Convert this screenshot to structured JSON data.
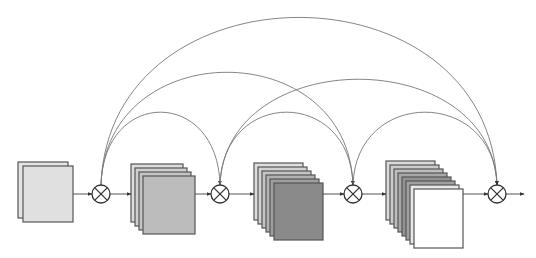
{
  "diagram": {
    "type": "dense-connectivity-block",
    "colors": {
      "line": "#555555",
      "arc": "#777777",
      "sheet_stroke": "#555555",
      "operator_stroke": "#333333",
      "background": "#ffffff"
    },
    "operator_symbol": "circled-times",
    "operators": [
      {
        "id": "op1",
        "cx": 101,
        "cy": 194,
        "r": 9
      },
      {
        "id": "op2",
        "cx": 220,
        "cy": 194,
        "r": 9
      },
      {
        "id": "op3",
        "cx": 353,
        "cy": 194,
        "r": 9
      },
      {
        "id": "op4",
        "cx": 497,
        "cy": 194,
        "r": 9
      }
    ],
    "stacks": [
      {
        "id": "stack1",
        "x": 18,
        "y": 162,
        "w": 50,
        "h": 56,
        "dx": 5,
        "dy": 4,
        "fills": [
          "#e4e4e4",
          "#e0e0e0"
        ]
      },
      {
        "id": "stack2",
        "x": 131,
        "y": 164,
        "w": 52,
        "h": 58,
        "dx": 4,
        "dy": 4,
        "fills": [
          "#dcdcdc",
          "#d0d0d0",
          "#c4c4c4",
          "#bcbcbc"
        ]
      },
      {
        "id": "stack3",
        "x": 254,
        "y": 163,
        "w": 49,
        "h": 57,
        "dx": 4,
        "dy": 4,
        "fills": [
          "#dedede",
          "#d2d2d2",
          "#c4c4c4",
          "#b2b2b2",
          "#9e9e9e",
          "#8a8a8a"
        ]
      },
      {
        "id": "stack4",
        "x": 386,
        "y": 161,
        "w": 49,
        "h": 59,
        "dx": 4,
        "dy": 4,
        "fills": [
          "#dadada",
          "#cccccc",
          "#bebebe",
          "#a8a8a8",
          "#929292",
          "#a0a0a0",
          "#e8e8e8",
          "#ffffff"
        ]
      }
    ],
    "flow_edges": [
      {
        "from": "stack1",
        "to": "op1",
        "x1": 73,
        "x2": 92,
        "y": 194
      },
      {
        "from": "op1",
        "to": "stack2",
        "x1": 110,
        "x2": 131,
        "y": 194
      },
      {
        "from": "stack2",
        "to": "op2",
        "x1": 195,
        "x2": 211,
        "y": 194
      },
      {
        "from": "op2",
        "to": "stack3",
        "x1": 229,
        "x2": 254,
        "y": 194
      },
      {
        "from": "stack3",
        "to": "op3",
        "x1": 322,
        "x2": 344,
        "y": 194
      },
      {
        "from": "op3",
        "to": "stack4",
        "x1": 362,
        "x2": 386,
        "y": 194
      },
      {
        "from": "stack4",
        "to": "op4",
        "x1": 463,
        "x2": 488,
        "y": 194
      },
      {
        "from": "op4",
        "to": "output",
        "x1": 506,
        "x2": 524,
        "y": 194
      }
    ],
    "skip_arcs": [
      {
        "from": "op1",
        "to": "op2",
        "peak_y": 112
      },
      {
        "from": "op1",
        "to": "op3",
        "peak_y": 72
      },
      {
        "from": "op1",
        "to": "op4",
        "peak_y": 17
      },
      {
        "from": "op2",
        "to": "op3",
        "peak_y": 112
      },
      {
        "from": "op2",
        "to": "op4",
        "peak_y": 79
      },
      {
        "from": "op3",
        "to": "op4",
        "peak_y": 112
      }
    ]
  }
}
